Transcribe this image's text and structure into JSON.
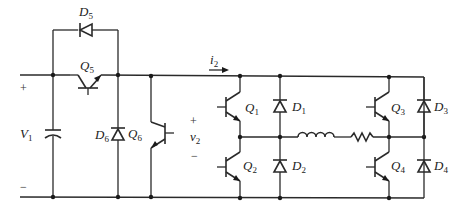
{
  "diagram": {
    "type": "circuit-schematic",
    "source": {
      "label": "V",
      "sub": "1",
      "plus": "+",
      "minus": "−"
    },
    "output_voltage": {
      "label": "v",
      "sub": "2",
      "plus": "+",
      "minus": "−"
    },
    "current": {
      "label": "i",
      "sub": "2"
    },
    "transistors": [
      {
        "id": "Q5",
        "label": "Q",
        "sub": "5"
      },
      {
        "id": "Q6",
        "label": "Q",
        "sub": "6"
      },
      {
        "id": "Q1",
        "label": "Q",
        "sub": "1"
      },
      {
        "id": "Q2",
        "label": "Q",
        "sub": "2"
      },
      {
        "id": "Q3",
        "label": "Q",
        "sub": "3"
      },
      {
        "id": "Q4",
        "label": "Q",
        "sub": "4"
      }
    ],
    "diodes": [
      {
        "id": "D5",
        "label": "D",
        "sub": "5"
      },
      {
        "id": "D6",
        "label": "D",
        "sub": "6"
      },
      {
        "id": "D1",
        "label": "D",
        "sub": "1"
      },
      {
        "id": "D2",
        "label": "D",
        "sub": "2"
      },
      {
        "id": "D3",
        "label": "D",
        "sub": "3"
      },
      {
        "id": "D4",
        "label": "D",
        "sub": "4"
      }
    ],
    "passives": [
      {
        "id": "C",
        "kind": "capacitor"
      },
      {
        "id": "L",
        "kind": "inductor"
      },
      {
        "id": "R",
        "kind": "resistor"
      }
    ],
    "colors": {
      "line": "#2a2a2a",
      "background": "#ffffff"
    }
  }
}
